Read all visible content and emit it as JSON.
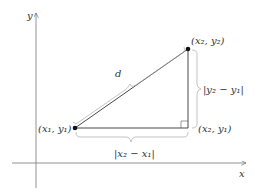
{
  "diagram": {
    "axes": {
      "x_label": "x",
      "y_label": "y"
    },
    "points": {
      "p1": {
        "label": "(x₁, y₁)"
      },
      "p2": {
        "label": "(x₂, y₂)"
      },
      "corner": {
        "label": "(x₂, y₁)"
      }
    },
    "segments": {
      "hypotenuse": {
        "label": "d"
      },
      "horizontal": {
        "label": "|x₂ − x₁|"
      },
      "vertical": {
        "label": "|y₂ − y₁|"
      }
    },
    "colors": {
      "line": "#333333",
      "brace": "#b0b0b0",
      "axis": "#666666"
    }
  }
}
